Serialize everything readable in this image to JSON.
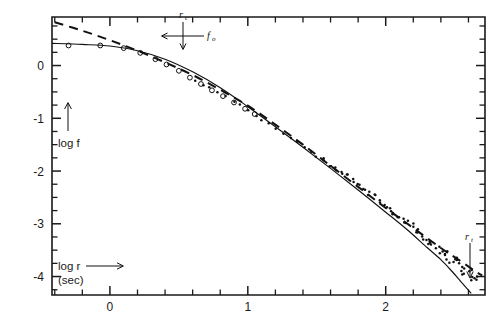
{
  "figure": {
    "background": "#ffffff",
    "ink_color": "#111111"
  },
  "axes": {
    "x": {
      "label": "log r",
      "sublabel": "(sec)",
      "arrow": "⟶",
      "ticklabels": [
        "0",
        "1",
        "2"
      ],
      "tickvalues": [
        0,
        1,
        2
      ],
      "range": [
        -0.42,
        2.72
      ],
      "minor_step": 0.2
    },
    "y": {
      "label": "log f",
      "arrow_icon": "up-arrow-icon",
      "ticklabels": [
        "0",
        "-1",
        "-2",
        "-3",
        "-4"
      ],
      "tickvalues": [
        0,
        -1,
        -2,
        -3,
        -4
      ],
      "range": [
        -4.35,
        0.92
      ],
      "minor_step": 0.25
    }
  },
  "annotations": [
    {
      "id": "core-radius-marker",
      "label_top": "r",
      "label_top_sub": "c",
      "label_right": "f",
      "label_right_sub": "o",
      "x": 0.86,
      "y": 0.62,
      "kind": "cross-arrows"
    },
    {
      "id": "tidal-radius-marker",
      "label": "r",
      "label_sub": "t",
      "x": 2.62,
      "y": -2.9,
      "kind": "down-arrow"
    }
  ],
  "chart_data": {
    "type": "scatter",
    "title": "",
    "xlabel": "log r (sec)",
    "ylabel": "log f",
    "xlim": [
      -0.42,
      2.72
    ],
    "ylim": [
      -4.35,
      0.92
    ],
    "grid": false,
    "legend": "none",
    "xticks": [
      0,
      1,
      2
    ],
    "yticks": [
      0,
      -1,
      -2,
      -3,
      -4
    ],
    "series": [
      {
        "name": "inner points (open circles)",
        "marker": "open-circle",
        "x": [
          -0.3,
          -0.07,
          0.1,
          0.22,
          0.33,
          0.41,
          0.5,
          0.58,
          0.66,
          0.74,
          0.82,
          0.9,
          0.98,
          1.05
        ],
        "y": [
          0.38,
          0.38,
          0.33,
          0.24,
          0.12,
          0.02,
          -0.1,
          -0.23,
          -0.35,
          -0.47,
          -0.58,
          -0.7,
          -0.82,
          -0.92
        ]
      },
      {
        "name": "outer points (filled dots)",
        "marker": "filled-dot",
        "x": [
          0.62,
          0.68,
          0.72,
          0.78,
          0.84,
          0.9,
          0.94,
          1.0,
          1.06,
          1.1,
          1.15,
          1.2,
          1.26,
          1.31,
          1.36,
          1.41,
          1.46,
          1.5,
          1.55,
          1.6,
          1.64,
          1.68,
          1.72,
          1.76,
          1.8,
          1.84,
          1.88,
          1.92,
          1.96,
          2.0,
          2.03,
          2.06,
          2.1,
          2.13,
          2.16,
          2.19,
          2.22,
          2.25,
          2.28,
          2.31,
          2.34,
          2.37,
          2.4,
          2.43,
          2.45,
          2.48,
          2.5,
          2.52,
          2.55,
          2.57,
          2.59,
          2.61,
          2.63,
          2.65
        ],
        "y": [
          -0.3,
          -0.38,
          -0.42,
          -0.5,
          -0.58,
          -0.68,
          -0.74,
          -0.84,
          -0.95,
          -1.02,
          -1.1,
          -1.18,
          -1.28,
          -1.36,
          -1.45,
          -1.53,
          -1.62,
          -1.7,
          -1.79,
          -1.88,
          -1.96,
          -2.03,
          -2.1,
          -2.18,
          -2.26,
          -2.33,
          -2.41,
          -2.49,
          -2.57,
          -2.65,
          -2.72,
          -2.78,
          -2.86,
          -2.92,
          -2.98,
          -3.05,
          -3.12,
          -3.18,
          -3.25,
          -3.32,
          -3.38,
          -3.45,
          -3.52,
          -3.58,
          -3.62,
          -3.68,
          -3.72,
          -3.76,
          -3.82,
          -3.86,
          -3.9,
          -3.94,
          -3.98,
          -4.02
        ]
      }
    ],
    "curves": [
      {
        "name": "king-model-fit",
        "style": "solid",
        "x": [
          -0.42,
          -0.2,
          0.0,
          0.2,
          0.4,
          0.6,
          0.8,
          1.0,
          1.2,
          1.4,
          1.6,
          1.8,
          2.0,
          2.15,
          2.3,
          2.4,
          2.48,
          2.54,
          2.58,
          2.62
        ],
        "y": [
          0.42,
          0.4,
          0.37,
          0.28,
          0.12,
          -0.12,
          -0.42,
          -0.78,
          -1.16,
          -1.55,
          -1.95,
          -2.36,
          -2.78,
          -3.1,
          -3.45,
          -3.68,
          -3.9,
          -4.08,
          -4.2,
          -4.32
        ]
      },
      {
        "name": "alternate-fit",
        "style": "dashed",
        "x": [
          -0.4,
          -0.2,
          0.0,
          0.2,
          0.4,
          0.6,
          0.8,
          1.0,
          1.2,
          1.4,
          1.6,
          1.8,
          2.0,
          2.2,
          2.4,
          2.55,
          2.65,
          2.7
        ],
        "y": [
          0.82,
          0.66,
          0.48,
          0.28,
          0.06,
          -0.18,
          -0.46,
          -0.76,
          -1.12,
          -1.5,
          -1.9,
          -2.3,
          -2.7,
          -3.08,
          -3.46,
          -3.72,
          -3.9,
          -3.98
        ]
      }
    ]
  }
}
